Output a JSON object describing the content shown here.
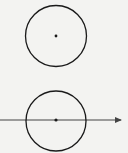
{
  "diagram": {
    "background": "#f3f3f1",
    "stroke_color": "#1a1a1a",
    "figures": [
      {
        "name": "circle-with-center",
        "circle": {
          "cx": 56,
          "cy": 36,
          "r": 30.5
        },
        "center_point": {
          "cx": 56,
          "cy": 36,
          "r": 1.4
        }
      },
      {
        "name": "circle-with-line-through-center",
        "circle": {
          "cx": 56,
          "cy": 121,
          "r": 30
        },
        "center_point": {
          "cx": 56,
          "cy": 120,
          "r": 1.6
        },
        "ray": {
          "x1": 0,
          "y1": 120,
          "x2": 121,
          "y2": 120,
          "arrow": "right"
        }
      }
    ]
  }
}
